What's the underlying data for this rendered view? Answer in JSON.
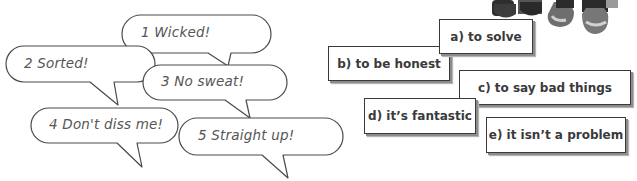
{
  "exercise": {
    "phrases": [
      {
        "number": "1",
        "text": "1 Wicked!"
      },
      {
        "number": "2",
        "text": "2 Sorted!"
      },
      {
        "number": "3",
        "text": "3 No sweat!"
      },
      {
        "number": "4",
        "text": "4 Don't diss me!"
      },
      {
        "number": "5",
        "text": "5 Straight up!"
      }
    ],
    "meanings": [
      {
        "letter": "a",
        "text": "a) to solve"
      },
      {
        "letter": "b",
        "text": "b) to be honest"
      },
      {
        "letter": "c",
        "text": "c) to say bad things"
      },
      {
        "letter": "d",
        "text": "d) it’s fantastic"
      },
      {
        "letter": "e",
        "text": "e) it isn’t a problem"
      }
    ]
  },
  "illustration": {
    "description": "partial photo of people's shoes/sneakers at top right"
  },
  "colors": {
    "bubble_stroke": "#4a4a4a",
    "text": "#555555",
    "card_border": "#3a3a3a",
    "card_shadow": "#8c8c8c"
  }
}
